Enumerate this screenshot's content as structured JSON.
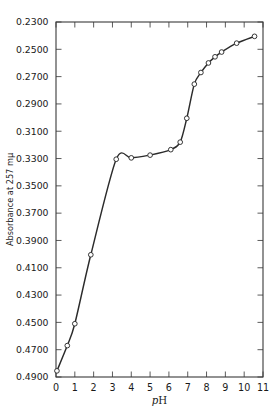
{
  "chart_data": {
    "type": "line",
    "title": "",
    "xlabel": "pH",
    "xlabel_italic_part": "p",
    "xlabel_roman_part": "H",
    "ylabel": "Absorbance at 257 mμ",
    "xlim": [
      0,
      11
    ],
    "ylim": [
      0.23,
      0.49
    ],
    "grid": false,
    "legend": null,
    "xticks": [
      "0",
      "1",
      "2",
      "3",
      "4",
      "5",
      "6",
      "7",
      "8",
      "9",
      "10",
      "11"
    ],
    "xtick_values": [
      0,
      1,
      2,
      3,
      4,
      5,
      6,
      7,
      8,
      9,
      10,
      11
    ],
    "yticks": [
      "0.4900",
      "0.4700",
      "0.4500",
      "0.4300",
      "0.4100",
      "0.3900",
      "0.3700",
      "0.3500",
      "0.3300",
      "0.3100",
      "0.2900",
      "0.2700",
      "0.2500",
      "0.2300"
    ],
    "ytick_values": [
      0.49,
      0.47,
      0.45,
      0.43,
      0.41,
      0.39,
      0.37,
      0.35,
      0.33,
      0.31,
      0.29,
      0.27,
      0.25,
      0.23
    ],
    "series": [
      {
        "name": "Absorbance vs pH",
        "marker": "open-circle",
        "line_color": "#2b2b2b",
        "marker_face": "#ffffff",
        "points": [
          {
            "x": 0.05,
            "y": 0.4855
          },
          {
            "x": 0.6,
            "y": 0.467
          },
          {
            "x": 1.0,
            "y": 0.451
          },
          {
            "x": 1.85,
            "y": 0.4005
          },
          {
            "x": 3.2,
            "y": 0.3305
          },
          {
            "x": 4.0,
            "y": 0.3295
          },
          {
            "x": 5.0,
            "y": 0.3275
          },
          {
            "x": 6.1,
            "y": 0.3235
          },
          {
            "x": 6.6,
            "y": 0.318
          },
          {
            "x": 6.95,
            "y": 0.3005
          },
          {
            "x": 7.35,
            "y": 0.2755
          },
          {
            "x": 7.7,
            "y": 0.267
          },
          {
            "x": 8.1,
            "y": 0.26
          },
          {
            "x": 8.45,
            "y": 0.2555
          },
          {
            "x": 8.8,
            "y": 0.252
          },
          {
            "x": 9.6,
            "y": 0.2455
          },
          {
            "x": 10.55,
            "y": 0.2405
          }
        ]
      }
    ]
  },
  "axes": {
    "frame": "box",
    "tick_direction": "inward",
    "top_axis_ticks": true,
    "right_axis_ticks": true
  }
}
